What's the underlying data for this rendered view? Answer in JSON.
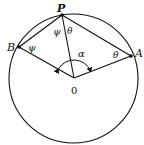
{
  "diagram": {
    "type": "geometry-circle",
    "colors": {
      "stroke": "#111111",
      "background": "#ffffff"
    },
    "circle": {
      "cx": 73.5,
      "cy": 78.5,
      "r": 64.5
    },
    "points": {
      "P": {
        "x": 62,
        "y": 15,
        "label": "P"
      },
      "B": {
        "x": 19,
        "y": 47,
        "label": "B"
      },
      "A": {
        "x": 131,
        "y": 56,
        "label": "A"
      },
      "O": {
        "x": 74,
        "y": 78,
        "label": "0"
      }
    },
    "angles": {
      "psi_at_P": "ψ",
      "psi_at_B": "ψ",
      "theta_at_P": "θ",
      "theta_at_A": "θ",
      "alpha_at_O": "α"
    }
  }
}
